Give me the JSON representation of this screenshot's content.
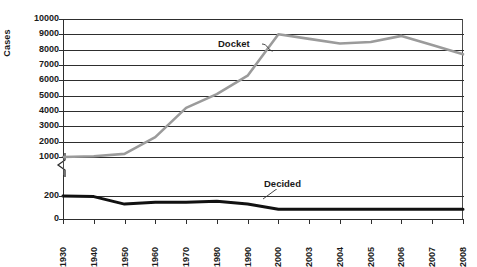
{
  "chart_data": {
    "type": "line",
    "title": "",
    "xlabel": "",
    "ylabel": "Cases",
    "categories": [
      "1930",
      "1940",
      "1950",
      "1960",
      "1970",
      "1980",
      "1990",
      "2000",
      "2003",
      "2004",
      "2005",
      "2006",
      "2007",
      "2008"
    ],
    "ylim": [
      0,
      10000
    ],
    "y_axis_break": {
      "from": 200,
      "to": 1000,
      "note": "broken axis between 200 and 1000"
    },
    "yticks_upper": [
      10000,
      9000,
      8000,
      7000,
      6000,
      5000,
      4000,
      3000,
      2000,
      1000
    ],
    "yticks_lower": [
      200,
      0
    ],
    "grid": true,
    "legend_position": "inline-annotations",
    "series": [
      {
        "name": "Docket",
        "color": "#9b9b9b",
        "values": [
          1000,
          1050,
          1200,
          2300,
          4200,
          5100,
          6300,
          9000,
          8700,
          8400,
          8500,
          8900,
          8300,
          7700
        ]
      },
      {
        "name": "Decided",
        "color": "#111111",
        "values": [
          200,
          195,
          130,
          145,
          145,
          155,
          130,
          85,
          85,
          85,
          85,
          85,
          85,
          85
        ]
      }
    ],
    "annotations": [
      {
        "text": "Docket",
        "series": "Docket"
      },
      {
        "text": "Decided",
        "series": "Decided"
      }
    ]
  }
}
